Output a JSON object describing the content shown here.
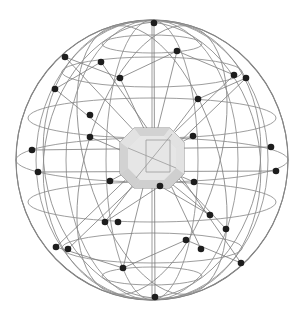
{
  "illustration": {
    "title": "Wireframe Network Sphere with Central Gem",
    "subject": "globe-network-gem",
    "background_color": "#ffffff",
    "wire_color": "#8d8d8d",
    "outline_color": "#6f6f6f",
    "chord_color": "#7a7a7a",
    "node_color": "#1d1d1d",
    "gem_fill": "#dcdcdc",
    "gem_outline": "#8f8f8f",
    "gem_table_fill": "#e6e6e6"
  },
  "chart_data": {
    "type": "scatter",
    "title": "Wireframe Network Sphere with Central Gem",
    "xlabel": "",
    "ylabel": "",
    "xlim": [
      0,
      306
    ],
    "ylim": [
      0,
      315
    ],
    "grid": false,
    "legend": "none",
    "sphere": {
      "center_x": 152,
      "center_y": 160,
      "radius_x": 136,
      "radius_y": 140,
      "meridian_count": 7,
      "latitude_count": 5
    },
    "gem": {
      "center_x": 152,
      "center_y": 158,
      "width": 64,
      "height": 60,
      "shape": "emerald-cut-octagon",
      "facet_count": 9
    },
    "node_count": 30,
    "nodes": [
      {
        "x": 154,
        "y": 23
      },
      {
        "x": 155,
        "y": 297
      },
      {
        "x": 65,
        "y": 57
      },
      {
        "x": 101,
        "y": 62
      },
      {
        "x": 177,
        "y": 51
      },
      {
        "x": 234,
        "y": 75
      },
      {
        "x": 246,
        "y": 78
      },
      {
        "x": 55,
        "y": 89
      },
      {
        "x": 120,
        "y": 78
      },
      {
        "x": 198,
        "y": 99
      },
      {
        "x": 32,
        "y": 150
      },
      {
        "x": 38,
        "y": 172
      },
      {
        "x": 271,
        "y": 147
      },
      {
        "x": 276,
        "y": 171
      },
      {
        "x": 90,
        "y": 137
      },
      {
        "x": 110,
        "y": 181
      },
      {
        "x": 193,
        "y": 136
      },
      {
        "x": 194,
        "y": 182
      },
      {
        "x": 56,
        "y": 247
      },
      {
        "x": 68,
        "y": 249
      },
      {
        "x": 105,
        "y": 222
      },
      {
        "x": 123,
        "y": 268
      },
      {
        "x": 186,
        "y": 240
      },
      {
        "x": 201,
        "y": 249
      },
      {
        "x": 160,
        "y": 186
      },
      {
        "x": 210,
        "y": 215
      },
      {
        "x": 226,
        "y": 229
      },
      {
        "x": 241,
        "y": 263
      },
      {
        "x": 90,
        "y": 115
      },
      {
        "x": 118,
        "y": 222
      }
    ],
    "chords": [
      {
        "x1": 65,
        "y1": 57,
        "x2": 226,
        "y2": 229
      },
      {
        "x1": 101,
        "y1": 62,
        "x2": 241,
        "y2": 263
      },
      {
        "x1": 234,
        "y1": 75,
        "x2": 56,
        "y2": 247
      },
      {
        "x1": 246,
        "y1": 78,
        "x2": 68,
        "y2": 249
      },
      {
        "x1": 32,
        "y1": 150,
        "x2": 271,
        "y2": 147
      },
      {
        "x1": 38,
        "y1": 172,
        "x2": 276,
        "y2": 171
      },
      {
        "x1": 154,
        "y1": 23,
        "x2": 155,
        "y2": 297
      },
      {
        "x1": 55,
        "y1": 89,
        "x2": 210,
        "y2": 215
      },
      {
        "x1": 120,
        "y1": 78,
        "x2": 201,
        "y2": 249
      },
      {
        "x1": 177,
        "y1": 51,
        "x2": 123,
        "y2": 268
      },
      {
        "x1": 198,
        "y1": 99,
        "x2": 105,
        "y2": 222
      },
      {
        "x1": 90,
        "y1": 137,
        "x2": 194,
        "y2": 182
      },
      {
        "x1": 110,
        "y1": 181,
        "x2": 193,
        "y2": 136
      },
      {
        "x1": 65,
        "y1": 57,
        "x2": 120,
        "y2": 78
      },
      {
        "x1": 120,
        "y1": 78,
        "x2": 177,
        "y2": 51
      },
      {
        "x1": 177,
        "y1": 51,
        "x2": 234,
        "y2": 75
      },
      {
        "x1": 55,
        "y1": 89,
        "x2": 101,
        "y2": 62
      },
      {
        "x1": 198,
        "y1": 99,
        "x2": 246,
        "y2": 78
      },
      {
        "x1": 56,
        "y1": 247,
        "x2": 123,
        "y2": 268
      },
      {
        "x1": 123,
        "y1": 268,
        "x2": 186,
        "y2": 240
      },
      {
        "x1": 186,
        "y1": 240,
        "x2": 241,
        "y2": 263
      },
      {
        "x1": 105,
        "y1": 222,
        "x2": 160,
        "y2": 186
      },
      {
        "x1": 160,
        "y1": 186,
        "x2": 210,
        "y2": 215
      }
    ]
  }
}
